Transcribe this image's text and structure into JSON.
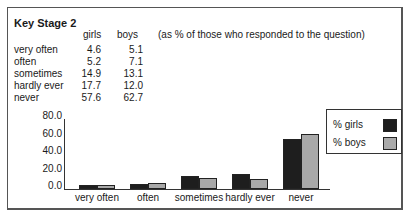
{
  "title": "Key Stage 2",
  "table": {
    "columns": [
      "girls",
      "boys"
    ],
    "note": "(as % of those who responded to the question)",
    "rows": [
      {
        "label": "very often",
        "girls": "4.6",
        "boys": "5.1"
      },
      {
        "label": "often",
        "girls": "5.2",
        "boys": "7.1"
      },
      {
        "label": "sometimes",
        "girls": "14.9",
        "boys": "13.1"
      },
      {
        "label": "hardly ever",
        "girls": "17.7",
        "boys": "12.0"
      },
      {
        "label": "never",
        "girls": "57.6",
        "boys": "62.7"
      }
    ]
  },
  "colors": {
    "girls": "#1e1e1e",
    "boys": "#a9a9a9"
  },
  "chart_data": {
    "type": "bar",
    "title": "Key Stage 2",
    "xlabel": "",
    "ylabel": "",
    "categories": [
      "very often",
      "often",
      "sometimes",
      "hardly ever",
      "never"
    ],
    "series": [
      {
        "name": "% girls",
        "values": [
          4.6,
          5.2,
          14.9,
          17.7,
          57.6
        ]
      },
      {
        "name": "% boys",
        "values": [
          5.1,
          7.1,
          13.1,
          12.0,
          62.7
        ]
      }
    ],
    "yticks": [
      "80.0",
      "60.0",
      "40.0",
      "20.0",
      "0.0"
    ],
    "ylim": [
      0,
      80
    ],
    "grid": false,
    "legend_position": "right"
  }
}
